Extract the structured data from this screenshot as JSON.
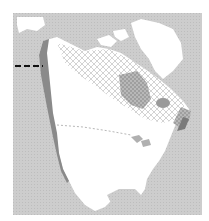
{
  "map": {
    "type": "species-range-map",
    "region": "North America",
    "colors": {
      "ocean": "#c9c9c9",
      "land": "#ffffff",
      "coast_outline": "#8a8a8a",
      "range_hatch": "#b5b5b5",
      "range_dense": "#9a9a9a",
      "marker": "#111111"
    },
    "legend": [],
    "labels": [],
    "features": [
      {
        "name": "crosshatched-range",
        "description": "hatched range across northern Canada from Alaska to Labrador"
      },
      {
        "name": "dense-range-hudson-bay",
        "description": "darker hatched zone west of Hudson Bay"
      },
      {
        "name": "dense-range-east",
        "description": "darker zone along Gulf of St. Lawrence / Newfoundland"
      },
      {
        "name": "west-coast-band",
        "description": "dark band along Pacific coast from Alaska to California"
      },
      {
        "name": "dashed-marker",
        "description": "black dashed line at western edge near Alaska"
      }
    ]
  }
}
